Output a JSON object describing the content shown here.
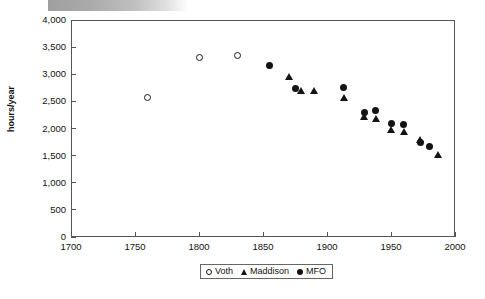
{
  "chart_data": {
    "type": "scatter",
    "title": "",
    "xlabel": "",
    "ylabel": "hours/year",
    "xlim": [
      1700,
      2000
    ],
    "ylim": [
      0,
      4000
    ],
    "xticks": [
      1700,
      1750,
      1800,
      1850,
      1900,
      1950,
      2000
    ],
    "xtick_labels": [
      "1700",
      "1750",
      "1800",
      "1850",
      "1900",
      "1950",
      "2000"
    ],
    "yticks": [
      0,
      500,
      1000,
      1500,
      2000,
      2500,
      3000,
      3500,
      4000
    ],
    "ytick_labels": [
      "0",
      "500",
      "1,000",
      "1,500",
      "2,000",
      "2,500",
      "3,000",
      "3,500",
      "4,000"
    ],
    "grid": false,
    "legend_position": "bottom-center",
    "series": [
      {
        "name": "Voth",
        "marker": "circle-open",
        "color": "#1a1a1a",
        "points": [
          {
            "x": 1760,
            "y": 2570
          },
          {
            "x": 1800,
            "y": 3310
          },
          {
            "x": 1830,
            "y": 3350
          }
        ]
      },
      {
        "name": "Maddison",
        "marker": "triangle-filled",
        "color": "#141414",
        "points": [
          {
            "x": 1870,
            "y": 2960
          },
          {
            "x": 1880,
            "y": 2700
          },
          {
            "x": 1890,
            "y": 2700
          },
          {
            "x": 1913,
            "y": 2570
          },
          {
            "x": 1929,
            "y": 2220
          },
          {
            "x": 1938,
            "y": 2190
          },
          {
            "x": 1950,
            "y": 1990
          },
          {
            "x": 1960,
            "y": 1940
          },
          {
            "x": 1973,
            "y": 1800
          },
          {
            "x": 1987,
            "y": 1520
          }
        ]
      },
      {
        "name": "MFO",
        "marker": "circle-filled",
        "color": "#141414",
        "points": [
          {
            "x": 1855,
            "y": 3170
          },
          {
            "x": 1875,
            "y": 2740
          },
          {
            "x": 1913,
            "y": 2750
          },
          {
            "x": 1929,
            "y": 2290
          },
          {
            "x": 1938,
            "y": 2330
          },
          {
            "x": 1950,
            "y": 2100
          },
          {
            "x": 1960,
            "y": 2070
          },
          {
            "x": 1973,
            "y": 1740
          },
          {
            "x": 1980,
            "y": 1660
          }
        ]
      }
    ]
  },
  "legend": {
    "entries": [
      {
        "label": "Voth",
        "marker": "circle-open"
      },
      {
        "label": "Maddison",
        "marker": "triangle-filled"
      },
      {
        "label": "MFO",
        "marker": "circle-filled"
      }
    ]
  }
}
